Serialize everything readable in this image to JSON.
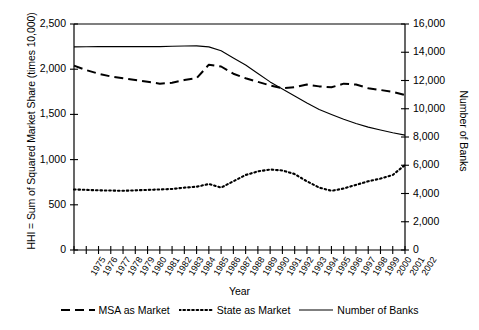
{
  "axes": {
    "y_left_label": "HHI = Sum of Squared Market Share (times 10,000)",
    "y_right_label": "Number of Banks",
    "x_label": "Year",
    "y_left_ticks": [
      "0",
      "500",
      "1,000",
      "1,500",
      "2,000",
      "2,500"
    ],
    "y_right_ticks": [
      "0",
      "2,000",
      "4,000",
      "6,000",
      "8,000",
      "10,000",
      "12,000",
      "14,000",
      "16,000"
    ]
  },
  "legend": {
    "items": [
      {
        "label": "MSA as Market",
        "style": "dashed"
      },
      {
        "label": "State as Market",
        "style": "dotted"
      },
      {
        "label": "Number of Banks",
        "style": "solid"
      }
    ]
  },
  "chart_data": {
    "type": "line",
    "title": "",
    "xlabel": "Year",
    "ylabel": "HHI = Sum of Squared Market Share (times 10,000)",
    "y2label": "Number of Banks",
    "ylim": [
      0,
      2500
    ],
    "y2lim": [
      0,
      16000
    ],
    "grid": false,
    "legend_position": "bottom",
    "x": [
      1975,
      1976,
      1977,
      1978,
      1979,
      1980,
      1981,
      1982,
      1983,
      1984,
      1985,
      1986,
      1987,
      1988,
      1989,
      1990,
      1991,
      1992,
      1993,
      1994,
      1995,
      1996,
      1997,
      1998,
      1999,
      2000,
      2001,
      2002
    ],
    "series": [
      {
        "name": "MSA as Market",
        "axis": "left",
        "style": "dashed",
        "values": [
          2040,
          1990,
          1950,
          1920,
          1900,
          1880,
          1860,
          1840,
          1850,
          1880,
          1900,
          2050,
          2030,
          1950,
          1900,
          1860,
          1820,
          1790,
          1800,
          1830,
          1810,
          1800,
          1840,
          1830,
          1790,
          1770,
          1750,
          1715
        ]
      },
      {
        "name": "State as Market",
        "axis": "left",
        "style": "dotted",
        "values": [
          670,
          665,
          660,
          658,
          655,
          660,
          665,
          670,
          675,
          690,
          700,
          730,
          690,
          760,
          830,
          870,
          890,
          880,
          840,
          760,
          690,
          655,
          680,
          720,
          760,
          790,
          830,
          940
        ]
      },
      {
        "name": "Number of Banks",
        "axis": "right",
        "style": "solid",
        "values": [
          14380,
          14390,
          14400,
          14400,
          14400,
          14400,
          14400,
          14400,
          14420,
          14440,
          14450,
          14380,
          14100,
          13600,
          13100,
          12500,
          11900,
          11400,
          10900,
          10400,
          9950,
          9600,
          9250,
          8950,
          8700,
          8500,
          8300,
          8130
        ]
      }
    ]
  }
}
